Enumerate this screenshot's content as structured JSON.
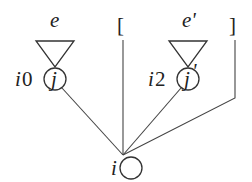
{
  "diagram": {
    "type": "tree",
    "root": {
      "label": "i"
    },
    "subtrees": [
      {
        "index_label": "i0",
        "node_label": "j",
        "triangle_label": "e"
      },
      {
        "index_label": "i2",
        "node_label": "j'",
        "triangle_label": "e'"
      }
    ],
    "optional_bracket": {
      "open": "[",
      "close": "]"
    }
  },
  "labels": {
    "left_triangle": "e",
    "right_triangle": "e'",
    "left_index_italic": "i",
    "left_index_digit": "0",
    "left_node": "j",
    "right_index_italic": "i",
    "right_index_digit": "2",
    "right_node": "j",
    "right_node_prime": "'",
    "root": "i",
    "bracket_open": "[",
    "bracket_close": "]"
  },
  "colors": {
    "line": "#333333",
    "text": "#222222",
    "background": "#ffffff"
  }
}
